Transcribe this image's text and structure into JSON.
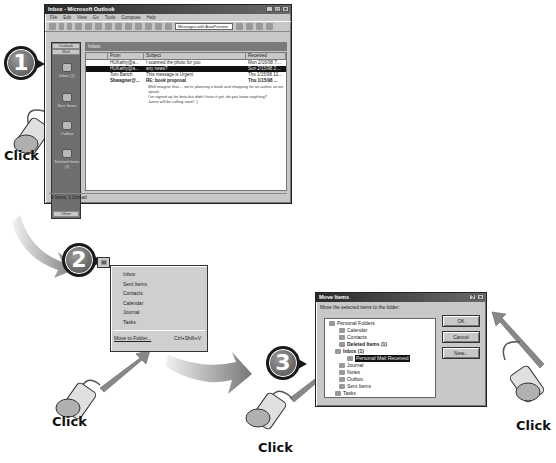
{
  "outlook_window": {
    "title": "Inbox - Microsoft Outlook",
    "title_buttons": [
      "_",
      "□",
      "×"
    ],
    "menu": [
      "File",
      "Edit",
      "View",
      "Go",
      "Tools",
      "Compose",
      "Help"
    ],
    "view_selector": "Messages with AutoPreview",
    "outlook_bar": {
      "header": "Outlook",
      "group": "Mail",
      "items": [
        "Inbox (1)",
        "Sent Items",
        "Outbox",
        "Deleted Items (1)"
      ],
      "footer": "Other"
    },
    "folder_banner": "Inbox",
    "columns": [
      "",
      "From",
      "Subject",
      "Received"
    ],
    "messages": [
      {
        "from": "HUKathy@a...",
        "subject": "I scanned the photo for you",
        "received": "Mon 2/16/98 7:...",
        "selected": false,
        "bold": false
      },
      {
        "from": "HUKathy@a...",
        "subject": "any news?",
        "received": "Sun 2/15/98 2:...",
        "selected": true,
        "bold": false
      },
      {
        "from": "Tom Barich",
        "subject": "This message is Urgent",
        "received": "Thu 1/15/98 12...",
        "selected": false,
        "bold": false
      },
      {
        "from": "Sbwagner@...",
        "subject": "RE: book proposal",
        "received": "Thu 1/15/98 ...",
        "selected": false,
        "bold": true
      }
    ],
    "preview_lines": [
      "Well imagine that.... we're planning a book and shopping for an author as we speak.",
      "I've signed up for beta but didn't have it yet, do you know anything?",
      "Jamie will be calling soon! :)"
    ],
    "status": "4 Items, 1 Unread"
  },
  "steps": [
    "1",
    "2",
    "3",
    "4"
  ],
  "click_label": "Click",
  "context_menu": {
    "items": [
      "Inbox",
      "Sent Items",
      "Contacts",
      "Calendar",
      "Journal",
      "Tasks"
    ],
    "move_label": "Move to Folder...",
    "move_shortcut": "Ctrl+Shift+V"
  },
  "move_dialog": {
    "title": "Move Items",
    "title_buttons": [
      "?",
      "×"
    ],
    "prompt": "Move the selected items to the folder:",
    "tree": [
      {
        "label": "Personal Folders",
        "bold": false,
        "selected": false
      },
      {
        "label": "Calendar",
        "bold": false,
        "selected": false
      },
      {
        "label": "Contacts",
        "bold": false,
        "selected": false
      },
      {
        "label": "Deleted Items (1)",
        "bold": true,
        "selected": false
      },
      {
        "label": "Inbox (1)",
        "bold": true,
        "selected": false
      },
      {
        "label": "Personal Mail Received",
        "bold": false,
        "selected": true
      },
      {
        "label": "Journal",
        "bold": false,
        "selected": false
      },
      {
        "label": "Notes",
        "bold": false,
        "selected": false
      },
      {
        "label": "Outbox",
        "bold": false,
        "selected": false
      },
      {
        "label": "Sent Items",
        "bold": false,
        "selected": false
      },
      {
        "label": "Tasks",
        "bold": false,
        "selected": false
      }
    ],
    "buttons": {
      "ok": "OK",
      "cancel": "Cancel",
      "new": "New..."
    }
  }
}
